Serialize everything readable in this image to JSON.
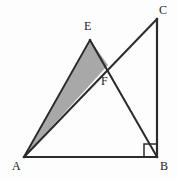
{
  "figure": {
    "background_color": "#fdfdfd",
    "stroke_color": "#2b2b2b",
    "shade_color": "#a8a8a8",
    "stroke_width": 2,
    "canvas": {
      "width": 178,
      "height": 179
    }
  },
  "points": {
    "A": {
      "label": "A",
      "x": 24,
      "y": 157
    },
    "B": {
      "label": "B",
      "x": 157,
      "y": 157
    },
    "C": {
      "label": "C",
      "x": 157,
      "y": 19
    },
    "E": {
      "label": "E",
      "x": 90,
      "y": 40
    },
    "F": {
      "label": "F",
      "x": 108,
      "y": 65
    }
  },
  "segments": [
    {
      "name": "AB",
      "from": "A",
      "to": "B"
    },
    {
      "name": "BC",
      "from": "B",
      "to": "C"
    },
    {
      "name": "AC",
      "from": "A",
      "to": "C"
    },
    {
      "name": "AE",
      "from": "A",
      "to": "E"
    },
    {
      "name": "EB",
      "from": "E",
      "to": "B"
    }
  ],
  "shaded_region": {
    "name": "triangle-AEF",
    "vertices": [
      "A",
      "E",
      "F"
    ],
    "polygon": "24,157 90,40 108,65",
    "fill": "#a8a8a8"
  },
  "right_angle": {
    "at": "B",
    "marker_size": 13,
    "polyline": "144,157 144,144 157,144"
  },
  "watermarks": {
    "left": "",
    "bottom": ""
  }
}
